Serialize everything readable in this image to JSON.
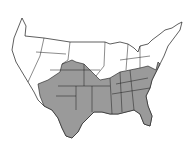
{
  "map": {
    "subject": "Contiguous United States",
    "shaded_region": "Southern and southeastern states",
    "colors": {
      "background": "#ffffff",
      "outline": "#1a1a1a",
      "shaded": "#9a9a9a",
      "unshaded": "#ffffff"
    }
  }
}
